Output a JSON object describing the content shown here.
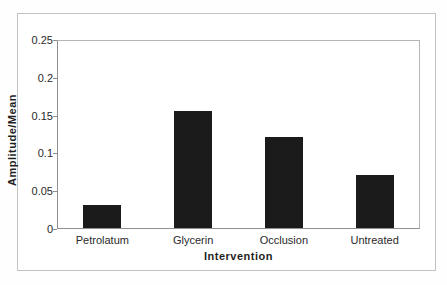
{
  "chart_data": {
    "type": "bar",
    "title": "",
    "categories": [
      "Petrolatum",
      "Glycerin",
      "Occlusion",
      "Untreated"
    ],
    "values": [
      0.03,
      0.155,
      0.12,
      0.07
    ],
    "xlabel": "Intervention",
    "ylabel": "Amplitude/Mean",
    "ylim": [
      0,
      0.25
    ],
    "yticks": [
      0,
      0.05,
      0.1,
      0.15,
      0.2,
      0.25
    ],
    "ytick_labels": [
      "0",
      "0.05",
      "0.1",
      "0.15",
      "0.2",
      "0.25"
    ],
    "bar_color": "#1b1b1b",
    "axis_color": "#8f8f8f",
    "plot_border_color": "#b5b5b5",
    "outer_border_color": "#c2c2c2",
    "grid": false,
    "legend_position": "none"
  }
}
